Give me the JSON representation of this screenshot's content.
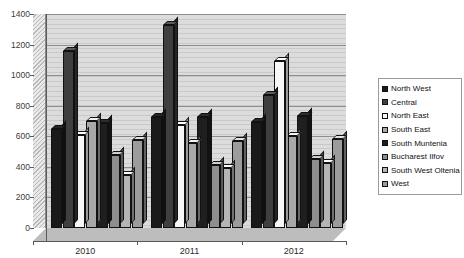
{
  "chart_data": {
    "type": "bar",
    "title": "",
    "xlabel": "",
    "ylabel": "",
    "ylim": [
      0,
      1400
    ],
    "ytick_step": 200,
    "yticks": [
      0,
      200,
      400,
      600,
      800,
      1000,
      1200,
      1400
    ],
    "grid": true,
    "legend_position": "right",
    "style": "3d-clustered-column",
    "categories": [
      "2010",
      "2011",
      "2012"
    ],
    "series": [
      {
        "name": "North West",
        "color": "#1a1a1a",
        "values": [
          645,
          725,
          695
        ]
      },
      {
        "name": "Central",
        "color": "#3f3f3f",
        "values": [
          1160,
          1325,
          870
        ]
      },
      {
        "name": "North East",
        "color": "#f7f7f7",
        "values": [
          610,
          675,
          1090
        ]
      },
      {
        "name": "South East",
        "color": "#a8a8a8",
        "values": [
          700,
          555,
          600
        ]
      },
      {
        "name": "South Muntenia",
        "color": "#1f1f1f",
        "values": [
          690,
          725,
          735
        ]
      },
      {
        "name": "Bucharest Ilfov",
        "color": "#8e8e8e",
        "values": [
          480,
          410,
          450
        ]
      },
      {
        "name": "South West Oltenia",
        "color": "#b5b5b5",
        "values": [
          345,
          390,
          425
        ]
      },
      {
        "name": "West",
        "color": "#9c9c9c",
        "values": [
          575,
          570,
          580
        ]
      }
    ]
  },
  "legend": {
    "items": [
      {
        "label": "North West"
      },
      {
        "label": "Central"
      },
      {
        "label": "North East"
      },
      {
        "label": "South East"
      },
      {
        "label": "South Muntenia"
      },
      {
        "label": "Bucharest Ilfov"
      },
      {
        "label": "South West Oltenia"
      },
      {
        "label": "West"
      }
    ]
  },
  "axes": {
    "y_tick_labels": [
      "1400",
      "1200",
      "1000",
      "800",
      "600",
      "400",
      "200",
      "0"
    ],
    "x_tick_labels": [
      "2010",
      "2011",
      "2012"
    ]
  }
}
